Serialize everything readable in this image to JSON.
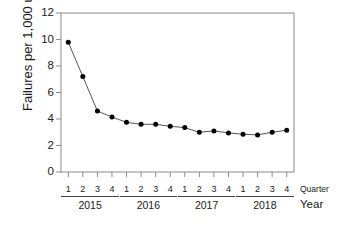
{
  "chart_data": {
    "type": "line",
    "title": "",
    "xlabel": "",
    "ylabel": "Failures per 1,000 units",
    "ylim": [
      0,
      12
    ],
    "yticks": [
      0,
      2,
      4,
      6,
      8,
      10,
      12
    ],
    "grid": false,
    "legend": null,
    "axis_row_labels": {
      "quarter": "Quarter",
      "year": "Year"
    },
    "groups": [
      {
        "year": "2015",
        "quarters": [
          "1",
          "2",
          "3",
          "4"
        ]
      },
      {
        "year": "2016",
        "quarters": [
          "1",
          "2",
          "3",
          "4"
        ]
      },
      {
        "year": "2017",
        "quarters": [
          "1",
          "2",
          "3",
          "4"
        ]
      },
      {
        "year": "2018",
        "quarters": [
          "1",
          "2",
          "3",
          "4"
        ]
      }
    ],
    "categories": [
      "2015 Q1",
      "2015 Q2",
      "2015 Q3",
      "2015 Q4",
      "2016 Q1",
      "2016 Q2",
      "2016 Q3",
      "2016 Q4",
      "2017 Q1",
      "2017 Q2",
      "2017 Q3",
      "2017 Q4",
      "2018 Q1",
      "2018 Q2",
      "2018 Q3",
      "2018 Q4"
    ],
    "values": [
      9.8,
      7.2,
      4.6,
      4.15,
      3.75,
      3.6,
      3.6,
      3.45,
      3.35,
      3.0,
      3.1,
      2.95,
      2.85,
      2.8,
      3.0,
      3.15
    ],
    "marker": "filled-circle",
    "line_color": "#555555",
    "marker_color": "#000000"
  }
}
